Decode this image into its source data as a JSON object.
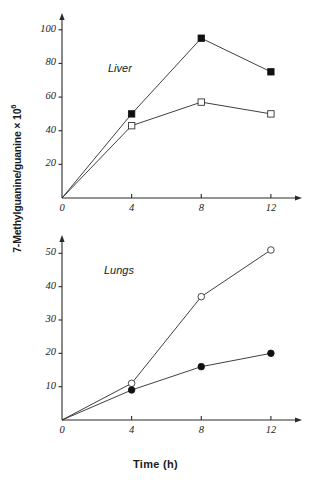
{
  "figure": {
    "axis_label_y_main": "7-Methylguanine/guanine × 10",
    "axis_label_y_exponent": "6",
    "axis_label_x": "Time (h)"
  },
  "panels": {
    "top": {
      "name": "Liver",
      "label": "Liver",
      "y_ticks": [
        "20",
        "40",
        "60",
        "80",
        "100"
      ],
      "x_ticks": [
        "0",
        "4",
        "8",
        "12"
      ]
    },
    "bottom": {
      "name": "Lungs",
      "label": "Lungs",
      "y_ticks": [
        "10",
        "20",
        "30",
        "40",
        "50"
      ],
      "x_ticks": [
        "0",
        "4",
        "8",
        "12"
      ]
    }
  },
  "chart_data": [
    {
      "type": "line",
      "title": "Liver",
      "xlabel": "Time (h)",
      "ylabel": "7-Methylguanine/guanine x 10^6",
      "x": [
        0,
        4,
        8,
        12
      ],
      "xlim": [
        0,
        13.5
      ],
      "ylim": [
        0,
        107
      ],
      "xticks": [
        0,
        4,
        8,
        12
      ],
      "yticks": [
        20,
        40,
        60,
        80,
        100
      ],
      "grid": false,
      "legend": "none",
      "series": [
        {
          "name": "filled-square",
          "marker": "filled-square",
          "values": [
            0,
            50,
            95,
            75
          ]
        },
        {
          "name": "open-square",
          "marker": "open-square",
          "values": [
            0,
            43,
            57,
            50
          ]
        }
      ]
    },
    {
      "type": "line",
      "title": "Lungs",
      "xlabel": "Time (h)",
      "ylabel": "7-Methylguanine/guanine x 10^6",
      "x": [
        0,
        4,
        8,
        12
      ],
      "xlim": [
        0,
        13.5
      ],
      "ylim": [
        0,
        54
      ],
      "xticks": [
        0,
        4,
        8,
        12
      ],
      "yticks": [
        10,
        20,
        30,
        40,
        50
      ],
      "grid": false,
      "legend": "none",
      "series": [
        {
          "name": "open-circle",
          "marker": "open-circle",
          "values": [
            0,
            11,
            37,
            51
          ]
        },
        {
          "name": "filled-circle",
          "marker": "filled-circle",
          "values": [
            0,
            9,
            16,
            20
          ]
        }
      ]
    }
  ]
}
